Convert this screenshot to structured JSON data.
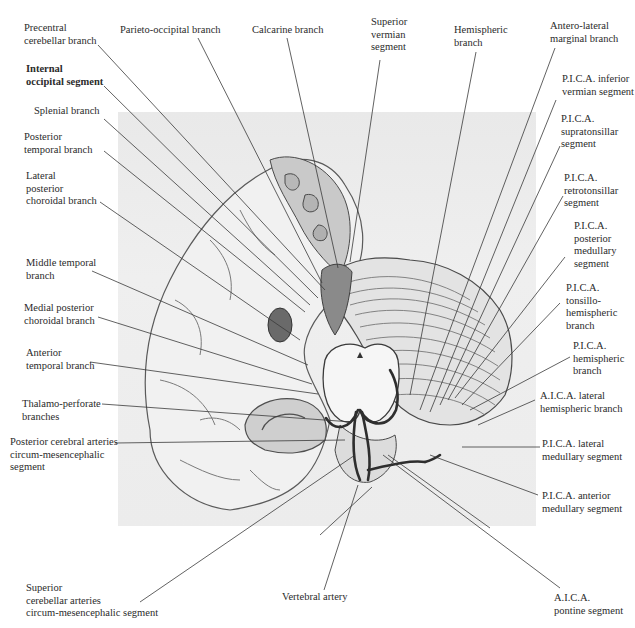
{
  "figure": {
    "type": "anatomical illustration"
  },
  "labels": {
    "left": [
      {
        "id": "precentral-cerebellar-branch",
        "text": "Precentral\ncerebellar branch"
      },
      {
        "id": "internal-occipital-segment",
        "text": "Internal\noccipital segment"
      },
      {
        "id": "splenial-branch",
        "text": "Splenial branch"
      },
      {
        "id": "posterior-temporal-branch",
        "text": "Posterior\ntemporal branch"
      },
      {
        "id": "lateral-posterior-choroidal-branch",
        "text": "Lateral\nposterior\nchoroidal branch"
      },
      {
        "id": "middle-temporal-branch",
        "text": "Middle temporal\nbranch"
      },
      {
        "id": "medial-posterior-choroidal-branch",
        "text": "Medial posterior\nchoroidal branch"
      },
      {
        "id": "anterior-temporal-branch",
        "text": "Anterior\ntemporal branch"
      },
      {
        "id": "thalamo-perforate-branches",
        "text": "Thalamo-perforate\nbranches"
      },
      {
        "id": "pca-circum-mesencephalic-segment",
        "text": "Posterior cerebral arteries\ncircum-mesencephalic\nsegment"
      },
      {
        "id": "sca-circum-mesencephalic-segment",
        "text": "Superior\ncerebellar arteries\ncircum-mesencephalic segment"
      }
    ],
    "top": [
      {
        "id": "parieto-occipital-branch",
        "text": "Parieto-occipital branch"
      },
      {
        "id": "calcarine-branch",
        "text": "Calcarine branch"
      },
      {
        "id": "superior-vermian-segment",
        "text": "Superior\nvermian\nsegment"
      },
      {
        "id": "hemispheric-branch",
        "text": "Hemispheric\nbranch"
      },
      {
        "id": "antero-lateral-marginal-branch",
        "text": "Antero-lateral\nmarginal branch"
      }
    ],
    "right": [
      {
        "id": "pica-inferior-vermian-segment",
        "text": "P.I.C.A. inferior\nvermian segment"
      },
      {
        "id": "pica-supratonsillar-segment",
        "text": "P.I.C.A.\nsupratonsillar\nsegment"
      },
      {
        "id": "pica-retrotonsillar-segment",
        "text": "P.I.C.A.\nretrotonsillar\nsegment"
      },
      {
        "id": "pica-posterior-medullary-segment",
        "text": "P.I.C.A.\nposterior\nmedullary\nsegment"
      },
      {
        "id": "pica-tonsillo-hemispheric-branch",
        "text": "P.I.C.A.\ntonsillo-\nhemispheric\nbranch"
      },
      {
        "id": "pica-hemispheric-branch",
        "text": "P.I.C.A.\nhemispheric\nbranch"
      },
      {
        "id": "aica-lateral-hemispheric-branch",
        "text": "A.I.C.A. lateral\nhemispheric branch"
      },
      {
        "id": "pica-lateral-medullary-segment",
        "text": "P.I.C.A. lateral\nmedullary segment"
      },
      {
        "id": "pica-anterior-medullary-segment",
        "text": "P.I.C.A. anterior\nmedullary segment"
      },
      {
        "id": "aica-pontine-segment",
        "text": "A.I.C.A.\npontine segment"
      }
    ],
    "bottom": [
      {
        "id": "vertebral-artery",
        "text": "Vertebral artery"
      }
    ]
  },
  "colors": {
    "background": "#ffffff",
    "plate": "#ececec",
    "leader_line": "#3a3a3a",
    "text": "#2b2b2b"
  }
}
